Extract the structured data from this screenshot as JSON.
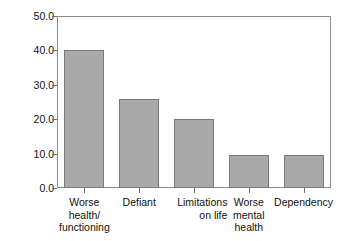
{
  "chart_data": {
    "type": "bar",
    "title": "",
    "xlabel": "",
    "ylabel": "Per cent",
    "categories": [
      "Worse health/ functioning",
      "Defiant",
      "Limitations on life",
      "Worse mental health",
      "Dependency"
    ],
    "category_lines": [
      [
        "Worse",
        "health/",
        "functioning"
      ],
      [
        "Defiant"
      ],
      [
        "Limitations",
        "on life"
      ],
      [
        "Worse",
        "mental",
        "health"
      ],
      [
        "Dependency"
      ]
    ],
    "values": [
      40.0,
      26.0,
      20.0,
      9.5,
      9.5
    ],
    "ylim": [
      0.0,
      50.0
    ],
    "ytick_labels": [
      "0.0",
      "10.0",
      "20.0",
      "30.0",
      "40.0",
      "50.0"
    ],
    "ytick_values": [
      0.0,
      10.0,
      20.0,
      30.0,
      40.0,
      50.0
    ],
    "grid": false,
    "legend": false,
    "legend_position": "none",
    "bar_fill_color": "#a9a9a9",
    "bar_edge_color": "#7a7a7a",
    "frame_color": "#8c8c8c",
    "background_color": "#ffffff",
    "text_color": "#111111"
  }
}
